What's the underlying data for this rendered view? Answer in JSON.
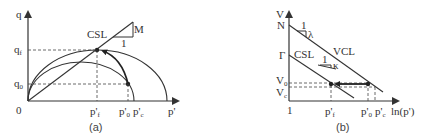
{
  "panel_a": {
    "caption": "(a)",
    "y_axis_label": "q",
    "x_axis_label": "p'",
    "origin_label": "0",
    "y_ticks": [
      {
        "label": "q",
        "sub": "f"
      },
      {
        "label": "q",
        "sub": "0"
      }
    ],
    "x_ticks": [
      {
        "label": "p'",
        "sub": "f"
      },
      {
        "label": "p'",
        "sub": "0"
      },
      {
        "label": "p'",
        "sub": "c"
      }
    ],
    "line_label": "CSL",
    "slope_label": "M",
    "slope_run": "1"
  },
  "panel_b": {
    "caption": "(b)",
    "y_axis_label": "V",
    "x_axis_label": "ln(p')",
    "origin_label": "1",
    "y_ticks": [
      {
        "label": "N"
      },
      {
        "label": "Γ"
      },
      {
        "label": "V",
        "sub": "0"
      },
      {
        "label": "V",
        "sub": "c"
      }
    ],
    "x_ticks": [
      {
        "label": "p'",
        "sub": "f"
      },
      {
        "label": "p'",
        "sub": "0"
      },
      {
        "label": "p'",
        "sub": "c"
      }
    ],
    "csl_label": "CSL",
    "vcl_label": "VCL",
    "vcl_slope_run": "1",
    "vcl_slope": "λ",
    "url_slope_run": "1",
    "url_slope": "κ"
  }
}
